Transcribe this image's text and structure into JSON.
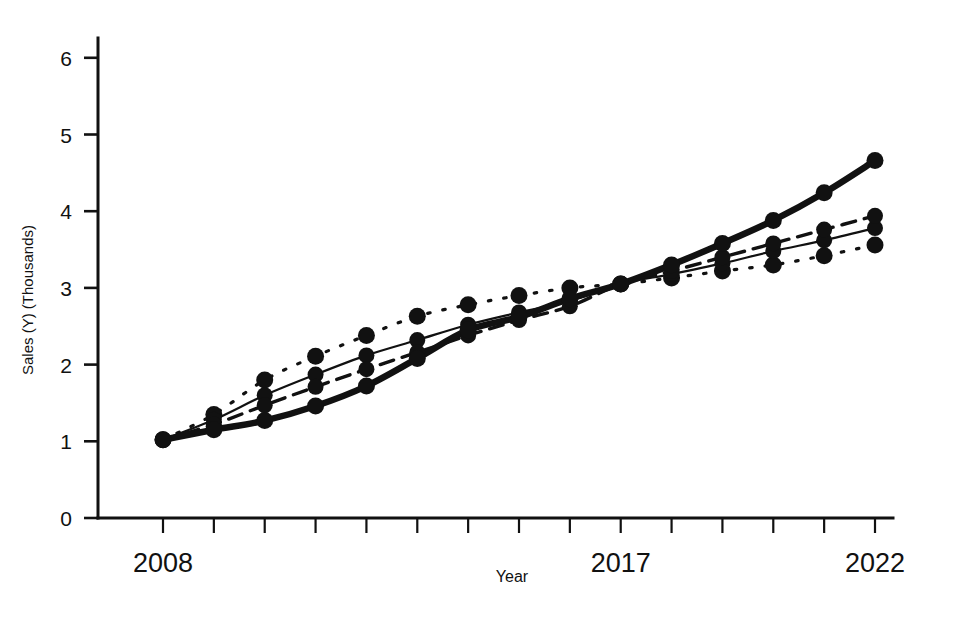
{
  "chart_data": {
    "type": "line",
    "title": "",
    "subtitle": "",
    "xlabel": "Year",
    "ylabel": "Sales (Y) (Thousands)",
    "x": [
      2008,
      2009,
      2010,
      2011,
      2012,
      2013,
      2014,
      2015,
      2016,
      2017,
      2018,
      2019,
      2020,
      2021,
      2022
    ],
    "xlim": [
      2008,
      2022
    ],
    "ylim": [
      0,
      6.2
    ],
    "xticks": [
      2008,
      2009,
      2010,
      2011,
      2012,
      2013,
      2014,
      2015,
      2016,
      2017,
      2018,
      2019,
      2020,
      2021,
      2022
    ],
    "xticklabels": [
      "2008",
      "",
      "",
      "",
      "",
      "",
      "",
      "",
      "",
      "2017",
      "",
      "",
      "",
      "",
      "2022"
    ],
    "yticks": [
      0,
      1,
      2,
      3,
      4,
      5,
      6
    ],
    "yticklabels": [
      "0",
      "1",
      "2",
      "3",
      "4",
      "5",
      "6"
    ],
    "grid": false,
    "legend": "none",
    "series": [
      {
        "name": "Dotted forecast (lowest at end)",
        "style": "dotted",
        "linewidth": 3.2,
        "marker": "circle",
        "values": [
          1.02,
          1.35,
          1.8,
          2.11,
          2.38,
          2.63,
          2.78,
          2.9,
          3.0,
          3.05,
          3.13,
          3.22,
          3.3,
          3.42,
          3.56
        ]
      },
      {
        "name": "Thin solid forecast",
        "style": "solid-thin",
        "linewidth": 2.2,
        "marker": "circle",
        "values": [
          1.02,
          1.28,
          1.6,
          1.87,
          2.12,
          2.32,
          2.52,
          2.68,
          2.83,
          3.05,
          3.18,
          3.32,
          3.48,
          3.62,
          3.78
        ]
      },
      {
        "name": "Dashed forecast",
        "style": "dashed",
        "linewidth": 3.4,
        "marker": "circle",
        "values": [
          1.02,
          1.22,
          1.47,
          1.71,
          1.94,
          2.16,
          2.38,
          2.58,
          2.76,
          3.05,
          3.22,
          3.4,
          3.58,
          3.76,
          3.94
        ]
      },
      {
        "name": "Thick solid forecast (highest at end)",
        "style": "solid-thick",
        "linewidth": 6.5,
        "marker": "circle",
        "values": [
          1.02,
          1.15,
          1.27,
          1.46,
          1.72,
          2.08,
          2.45,
          2.62,
          2.86,
          3.05,
          3.3,
          3.58,
          3.88,
          4.24,
          4.66
        ]
      }
    ]
  },
  "colors": {
    "ink": "#111111",
    "paper": "#ffffff"
  }
}
